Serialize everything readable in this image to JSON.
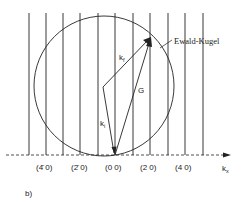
{
  "figure_label": "b)",
  "sphere_label": "Ewald-Kugel",
  "vectors": {
    "k_f": "k",
    "k_f_sub": "f",
    "k_i": "k",
    "k_i_sub": "i",
    "G": "G"
  },
  "axis": {
    "label": "k",
    "label_sub": "x"
  },
  "reflections": [
    {
      "label": "(4̄ 0)"
    },
    {
      "label": "(2̄ 0)"
    },
    {
      "label": "(0 0)"
    },
    {
      "label": "(2 0)"
    },
    {
      "label": "(4 0)"
    }
  ],
  "colors": {
    "line": "#222222",
    "background": "#ffffff"
  }
}
